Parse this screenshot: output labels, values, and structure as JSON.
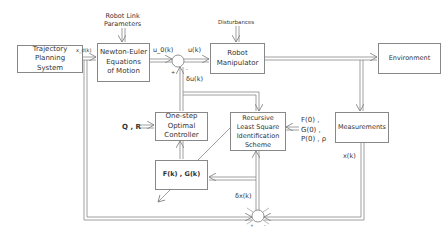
{
  "diagram": {
    "blocks": {
      "trajectory": "Trajectory\nPlanning\nSystem",
      "newton_euler": "Newton-Euler\nEquations\nof Motion",
      "robot": "Robot\nManipulator",
      "environment": "Environment",
      "controller": "One-step\nOptimal\nController",
      "rls": "Recursive\nLeast Square\nIdentification\nScheme",
      "fg": "F(k) , G(k)",
      "measurements": "Measurements"
    },
    "labels": {
      "robot_link_params": "Robot Link\nParameters",
      "disturbances": "Disturbances",
      "xd": "x_d(k)",
      "u0": "u_0(k)",
      "u": "u(k)",
      "du": "δu(k)",
      "qr": "Q , R",
      "init": "F(0) ,\nG(0) ,\nP(0) , ρ",
      "x": "x(k)",
      "dx": "δx(k)",
      "plus1": "+",
      "minus1": "-",
      "plus2": "+",
      "minus2": "-"
    }
  }
}
